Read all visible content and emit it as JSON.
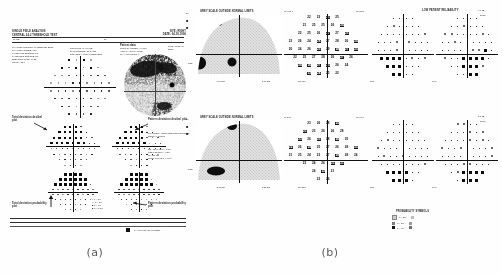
{
  "figure": {
    "caption_a": "(a)",
    "caption_b": "(b)",
    "background": "#fefefe",
    "ink": "#1a1a1a"
  },
  "panel_a": {
    "title": "SINGLE FIELD ANALYSIS",
    "subtitle_left": "CENTRAL 24-2 THRESHOLD TEST",
    "subtitle_right": "EYE: RIGHT",
    "name_label": "NAME:",
    "dob_label": "DOB:",
    "id_label": "ID:",
    "date_label": "DATE: 04-18-1996",
    "time_label": "TIME: 10:32 AM",
    "stimulus_line": "FIXATION MONITOR: GAZE/BLIND SPOT",
    "reliability": {
      "fixation_losses": "FIXATION LOSSES:  1/19",
      "false_pos": "FALSE POS ERRORS:  1%",
      "false_neg": "FALSE NEG ERRORS:  3%",
      "test_duration": "TEST DURATION:  14:22",
      "fovea": "FOVEA:  OFF"
    },
    "test_params": [
      "STIMULUS: III, WHITE",
      "BACKGROUND: 31.5 ASB",
      "STRATEGY: FULL THRESHOLD"
    ],
    "patient_data_header": "Patient data",
    "patient_data": [
      "PUPIL DIAMETER: 4.0 MM",
      "VISUAL ACUITY: 20/25",
      "RX: +1.00 DS    DC  X"
    ],
    "global_indices": [
      "MD  -12.47 dB  P < 0.5%",
      "PSD   8.32 dB  P < 0.5%",
      "SF    2.11 dB",
      "CPSD  7.88 dB  P < 0.5%"
    ],
    "annotations": {
      "total_dev_numeric": "Total deviation\ndecibel plot",
      "total_dev_prob": "Total deviation\nprobability plot",
      "pattern_dev_numeric": "Pattern deviation\ndecibel plot",
      "pattern_dev_prob": "Pattern deviation\nprobability plot",
      "grayscale": "Grayscale",
      "ght_label": "GLAUCOMA HEMIFIELD TEST\nOUTSIDE NORMAL LIMITS"
    },
    "plot_titles": {
      "total_top": "Total deviation",
      "pattern_top": "Pattern deviation"
    },
    "footer_note": "OUTSIDE NORMAL LIMITS",
    "footer_swatch_label": "= P < 0.5% BLACK SYMBOL",
    "probability_legend": [
      ":: P < 5%",
      "## P < 2%",
      "■ P < 1%",
      "■ P < 0.5%"
    ]
  },
  "panel_b": {
    "rows": [
      {
        "grayscale_header": "GREY SCALE  OUTSIDE NORMAL LIMITS",
        "left_axis_marks": [
          "30",
          "■",
          "■"
        ],
        "fl_label": "FL  4/15 x",
        "fp_label": "FP  8/12",
        "fn_label": "FN  1/10",
        "reliability_header": "LOW PATIENT RELIABILITY",
        "md_value": "-6.87 DB",
        "psd_value": "2.17 DB",
        "right_top_1": "4.8 dB",
        "right_top_2": "30/15",
        "axis_label_bottom_left": "PSD",
        "axis_label_bottom_mid": "OFF",
        "axis_label_bottom_right": "GHT",
        "threshold_values": [
          [
            22,
            23,
            21,
            25
          ],
          [
            21,
            25,
            25,
            26,
            24
          ],
          [
            22,
            25,
            26,
            27,
            27,
            23
          ],
          [
            23,
            26,
            24,
            28,
            27,
            28,
            26,
            24
          ],
          [
            20,
            24,
            26,
            25,
            29,
            28,
            27,
            25
          ],
          [
            22,
            25,
            27,
            28,
            26,
            27,
            26
          ],
          [
            24,
            26,
            27,
            25,
            26,
            24
          ],
          [
            23,
            24,
            25,
            22
          ]
        ]
      },
      {
        "grayscale_header": "GREY SCALE  OUTSIDE NORMAL LIMITS",
        "left_axis_marks": [
          "30",
          "■",
          "■"
        ],
        "fl_label": "FL  5/14",
        "fp_label": "FP  6/17",
        "fn_label": "FN  2/13",
        "reliability_header": "",
        "md_value": "-2.27 DB",
        "psd_value": "5.28 DB",
        "right_top_1": "1.3 dB",
        "right_top_2": "30/15",
        "axis_label_bottom_left": "PSD",
        "axis_label_bottom_mid": "OFF",
        "axis_label_bottom_right": "GHT",
        "threshold_values": [
          [
            23,
            26,
            28,
            25
          ],
          [
            23,
            23,
            26,
            26,
            28
          ],
          [
            23,
            26,
            25,
            28,
            26,
            25
          ],
          [
            22,
            26,
            29,
            25,
            27,
            26,
            28,
            25
          ],
          [
            21,
            25,
            24,
            23,
            27,
            29,
            28,
            24
          ],
          [
            23,
            24,
            26,
            23,
            21
          ],
          [
            24,
            22,
            21
          ],
          [
            22,
            26
          ]
        ]
      }
    ],
    "probability_symbols": {
      "title": "PROBABILITY SYMBOLS",
      "rows": [
        {
          "symbol": "::",
          "label": "P < 5%",
          "swatch": "light"
        },
        {
          "symbol": "▒",
          "label": "P < 2%",
          "swatch": "mid"
        },
        {
          "symbol": "■",
          "label": "P < 1%",
          "swatch": "dark"
        }
      ]
    }
  },
  "colors": {
    "ink": "#111111",
    "gray_light": "#d8d8d8",
    "gray_mid": "#8e8e8e",
    "gray_dark": "#3a3a3a",
    "paper": "#fefefe"
  }
}
